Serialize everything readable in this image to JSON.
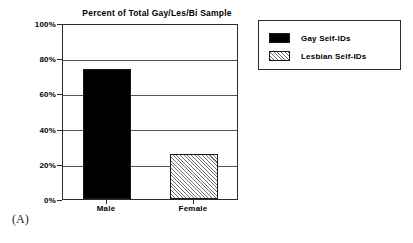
{
  "panel": {
    "caption": "(A)"
  },
  "legend": {
    "position": "right",
    "entries": [
      {
        "label": "Gay Self-IDs",
        "swatch": "solid-black",
        "color": "#000000"
      },
      {
        "label": "Lesbian Self-IDs",
        "swatch": "diagonal-hatch",
        "color": "#6f6f6f"
      }
    ]
  },
  "chart_data": {
    "type": "bar",
    "title": "Percent of Total Gay/Les/Bi Sample",
    "xlabel": "",
    "ylabel": "",
    "categories": [
      "Male",
      "Female"
    ],
    "series": [
      {
        "name": "Gay Self-IDs",
        "values": [
          75,
          null
        ]
      },
      {
        "name": "Lesbian Self-IDs",
        "values": [
          null,
          26
        ]
      }
    ],
    "values": [
      75,
      26
    ],
    "ylim": [
      0,
      100
    ],
    "ytick_labels": [
      "0%",
      "20%",
      "40%",
      "60%",
      "80%",
      "100%"
    ],
    "ytick_values": [
      0,
      20,
      40,
      60,
      80,
      100
    ],
    "grid": true,
    "grid_axis": "y",
    "legend_position": "right"
  }
}
